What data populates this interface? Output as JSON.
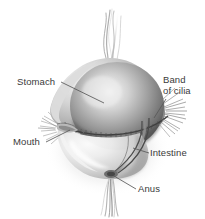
{
  "figure": {
    "background_color": "#ffffff",
    "label_color": "#3a3a3a",
    "leader_line_color": "#555555",
    "body_colors": {
      "outer_body_light": "#e8e8e8",
      "outer_body_mid": "#c4c4c4",
      "outer_body_dark": "#8e8e8e",
      "stomach_highlight": "#f2f2f2",
      "stomach_mid": "#9a9a9a",
      "stomach_dark": "#4e4e4e",
      "cilia": "#7a7a7a",
      "tentacle": "#a8a8a8",
      "shadow": "#d9d9d9"
    }
  },
  "labels": {
    "stomach": "Stomach",
    "band_of_cilia_line1": "Band",
    "band_of_cilia_line2": "of cilia",
    "mouth": "Mouth",
    "intestine": "Intestine",
    "anus": "Anus"
  }
}
